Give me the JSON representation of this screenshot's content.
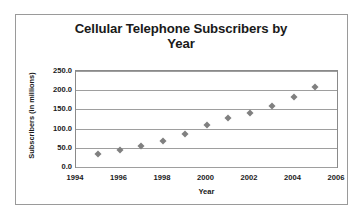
{
  "chart_data": {
    "type": "scatter",
    "title": "Cellular Telephone Subscribers by Year",
    "title_line1": "Cellular Telephone Subscribers by",
    "title_line2": "Year",
    "xlabel": "Year",
    "ylabel": "Subscribers (in millions)",
    "x": [
      1995,
      1996,
      1997,
      1998,
      1999,
      2000,
      2001,
      2002,
      2003,
      2004,
      2005
    ],
    "values": [
      34,
      44,
      55,
      69,
      86,
      110,
      128,
      141,
      159,
      182,
      208
    ],
    "series": [
      {
        "name": "Subscribers",
        "values": [
          34,
          44,
          55,
          69,
          86,
          110,
          128,
          141,
          159,
          182,
          208
        ]
      }
    ],
    "xlim": [
      1994,
      2006
    ],
    "ylim": [
      0,
      250
    ],
    "xticks": [
      1994,
      1996,
      1998,
      2000,
      2002,
      2004,
      2006
    ],
    "xtick_labels": [
      "1994",
      "1996",
      "1998",
      "2000",
      "2002",
      "2004",
      "2006"
    ],
    "yticks": [
      0,
      50,
      100,
      150,
      200,
      250
    ],
    "ytick_labels": [
      "0.0",
      "50.0",
      "100.0",
      "150.0",
      "200.0",
      "250.0"
    ],
    "grid": "horizontal",
    "legend": "none",
    "marker": "diamond",
    "marker_color": "#808080",
    "grid_color": "#9e9e9e",
    "axis_color": "#8a8a8a",
    "text_color": "#1a1a1a",
    "border_color": "#9a9a9a",
    "background": "#ffffff"
  }
}
